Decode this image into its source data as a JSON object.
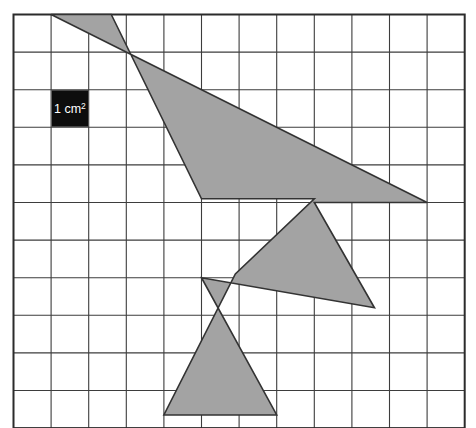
{
  "figure": {
    "kind": "grid-area-figure",
    "canvas": {
      "width": 476,
      "height": 428,
      "background": "#ffffff"
    },
    "grid": {
      "origin_x": 13.5,
      "origin_y": 14.5,
      "cell_size": 37.6,
      "cols": 12,
      "rows": 11,
      "line_color": "#3d3d3d",
      "line_width": 1.1,
      "border_color": "#2b2b2b",
      "border_width": 2.0,
      "fill": "#ffffff"
    },
    "shape": {
      "name": "zigzag-polygon",
      "fill_color": "#a3a3a3",
      "stroke_color": "#333333",
      "stroke_width": 1.6,
      "grid_points": [
        [
          1,
          0
        ],
        [
          11,
          5
        ],
        [
          8,
          5
        ],
        [
          9.6,
          7.8
        ],
        [
          5,
          7
        ],
        [
          7,
          10.65
        ],
        [
          4,
          10.65
        ],
        [
          5.9,
          6.9
        ],
        [
          8,
          4.9
        ],
        [
          5,
          4.9
        ],
        [
          2.6,
          0
        ]
      ]
    },
    "unit_key": {
      "name": "unit-area-key",
      "label_main": "1 cm",
      "label_sup": "2",
      "label_full": "1 cm²",
      "grid_col": 1,
      "grid_row": 2,
      "box_color": "#0d0d0d",
      "text_color": "#ffffff"
    }
  }
}
